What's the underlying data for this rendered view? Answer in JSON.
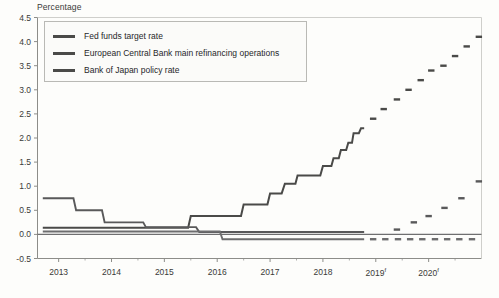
{
  "chart_data": {
    "type": "line",
    "title": "",
    "ylabel": "Percentage",
    "xlabel": "",
    "ylim": [
      -0.5,
      4.5
    ],
    "xlim": [
      2012.6,
      2021.0
    ],
    "grid": false,
    "legend_position": "top-left",
    "ytick_labels": [
      "4.5",
      "4.0",
      "3.5",
      "3.0",
      "2.5",
      "2.0",
      "1.5",
      "1.0",
      "0.5",
      "0.0",
      "-0.5"
    ],
    "ytick_values": [
      4.5,
      4.0,
      3.5,
      3.0,
      2.5,
      2.0,
      1.5,
      1.0,
      0.5,
      0.0,
      -0.5
    ],
    "xtick_labels": [
      "2013",
      "2014",
      "2015",
      "2016",
      "2017",
      "2018",
      "2019",
      "2020"
    ],
    "xtick_values": [
      2013,
      2014,
      2015,
      2016,
      2017,
      2018,
      2019,
      2020
    ],
    "xtick_forecast_flags": [
      false,
      false,
      false,
      false,
      false,
      false,
      true,
      true
    ],
    "forecast_marker": "f",
    "forecast_start": 2018.6,
    "series": [
      {
        "name": "Fed funds target rate",
        "color": "#4a4a48",
        "style": "step",
        "actual": [
          {
            "x": 2012.7,
            "y": 0.14
          },
          {
            "x": 2015.45,
            "y": 0.14
          },
          {
            "x": 2015.5,
            "y": 0.38
          },
          {
            "x": 2016.45,
            "y": 0.38
          },
          {
            "x": 2016.5,
            "y": 0.62
          },
          {
            "x": 2016.95,
            "y": 0.62
          },
          {
            "x": 2017.0,
            "y": 0.85
          },
          {
            "x": 2017.22,
            "y": 0.85
          },
          {
            "x": 2017.28,
            "y": 1.05
          },
          {
            "x": 2017.48,
            "y": 1.05
          },
          {
            "x": 2017.52,
            "y": 1.22
          },
          {
            "x": 2017.95,
            "y": 1.22
          },
          {
            "x": 2018.0,
            "y": 1.42
          },
          {
            "x": 2018.16,
            "y": 1.42
          },
          {
            "x": 2018.2,
            "y": 1.58
          },
          {
            "x": 2018.3,
            "y": 1.58
          },
          {
            "x": 2018.34,
            "y": 1.75
          },
          {
            "x": 2018.44,
            "y": 1.75
          },
          {
            "x": 2018.48,
            "y": 1.9
          },
          {
            "x": 2018.55,
            "y": 1.9
          },
          {
            "x": 2018.58,
            "y": 2.1
          },
          {
            "x": 2018.68,
            "y": 2.1
          },
          {
            "x": 2018.72,
            "y": 2.2
          },
          {
            "x": 2018.78,
            "y": 2.2
          }
        ],
        "forecast": [
          {
            "x": 2018.95,
            "y": 2.4
          },
          {
            "x": 2019.15,
            "y": 2.6
          },
          {
            "x": 2019.4,
            "y": 2.8
          },
          {
            "x": 2019.62,
            "y": 3.0
          },
          {
            "x": 2019.85,
            "y": 3.2
          },
          {
            "x": 2020.05,
            "y": 3.4
          },
          {
            "x": 2020.28,
            "y": 3.5
          },
          {
            "x": 2020.5,
            "y": 3.7
          },
          {
            "x": 2020.72,
            "y": 3.9
          },
          {
            "x": 2020.95,
            "y": 4.1
          }
        ]
      },
      {
        "name": "European Central Bank main refinancing operations",
        "color": "#59595a",
        "style": "step",
        "actual": [
          {
            "x": 2012.7,
            "y": 0.75
          },
          {
            "x": 2013.28,
            "y": 0.75
          },
          {
            "x": 2013.33,
            "y": 0.5
          },
          {
            "x": 2013.82,
            "y": 0.5
          },
          {
            "x": 2013.87,
            "y": 0.25
          },
          {
            "x": 2014.6,
            "y": 0.25
          },
          {
            "x": 2014.65,
            "y": 0.15
          },
          {
            "x": 2015.6,
            "y": 0.15
          },
          {
            "x": 2015.66,
            "y": 0.05
          },
          {
            "x": 2018.78,
            "y": 0.05
          }
        ],
        "forecast": [
          {
            "x": 2019.4,
            "y": 0.1
          },
          {
            "x": 2019.72,
            "y": 0.25
          },
          {
            "x": 2020.0,
            "y": 0.38
          },
          {
            "x": 2020.3,
            "y": 0.55
          },
          {
            "x": 2020.62,
            "y": 0.75
          },
          {
            "x": 2020.95,
            "y": 1.1
          }
        ]
      },
      {
        "name": "Bank of Japan policy rate",
        "color": "#6d6d6e",
        "style": "step",
        "actual": [
          {
            "x": 2012.7,
            "y": 0.06
          },
          {
            "x": 2016.05,
            "y": 0.06
          },
          {
            "x": 2016.1,
            "y": -0.1
          },
          {
            "x": 2018.78,
            "y": -0.1
          }
        ],
        "forecast": [
          {
            "x": 2018.95,
            "y": -0.1
          },
          {
            "x": 2019.18,
            "y": -0.1
          },
          {
            "x": 2019.42,
            "y": -0.1
          },
          {
            "x": 2019.65,
            "y": -0.1
          },
          {
            "x": 2019.88,
            "y": -0.1
          },
          {
            "x": 2020.12,
            "y": -0.1
          },
          {
            "x": 2020.35,
            "y": -0.1
          },
          {
            "x": 2020.58,
            "y": -0.1
          },
          {
            "x": 2020.82,
            "y": -0.1
          }
        ]
      }
    ]
  },
  "legend": {
    "items": [
      {
        "label": "Fed funds target rate"
      },
      {
        "label": "European Central Bank main refinancing operations"
      },
      {
        "label": "Bank of Japan policy rate"
      }
    ]
  },
  "colors": {
    "axis": "#8d8d89",
    "text": "#3a3a38",
    "series_1": "#4a4a48",
    "series_2": "#59595a",
    "series_3": "#6d6d6e",
    "plot_background": "#fdfdfb"
  }
}
